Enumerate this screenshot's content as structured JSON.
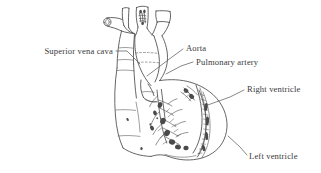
{
  "figure": {
    "background_color": "#ffffff",
    "line_color": "#4a4a4a",
    "text_color": "#3a3a3a",
    "style": "pen-and-ink line drawing with hatched shading"
  },
  "labels": [
    {
      "id": "superior-vena-cava",
      "text": "Superior vena cava",
      "align": "end",
      "text_x": 113,
      "text_y": 54,
      "leader": "M 116,51 L 127,51 L 140,64"
    },
    {
      "id": "aorta",
      "text": "Aorta",
      "align": "start",
      "text_x": 186,
      "text_y": 51,
      "leader": "M 183,49 L 172,57 L 147,76"
    },
    {
      "id": "pulmonary-artery",
      "text": "Pulmonary artery",
      "align": "start",
      "text_x": 196,
      "text_y": 65,
      "leader": "M 193,62 L 181,66 L 166,74"
    },
    {
      "id": "right-ventricle",
      "text": "Right ventricle",
      "align": "start",
      "text_x": 247,
      "text_y": 92,
      "leader": "M 244,90 L 230,97 L 205,106"
    },
    {
      "id": "left-ventricle",
      "text": "Left ventricle",
      "align": "start",
      "text_x": 249,
      "text_y": 159,
      "leader": "M 247,155 L 240,147 L 228,136"
    }
  ],
  "anatomy_parts": [
    "superior vena cava",
    "aortic arch",
    "brachiocephalic trunk",
    "left common carotid artery",
    "left subclavian artery",
    "pulmonary artery",
    "right atrium",
    "right ventricle",
    "left ventricle",
    "coronary arteries"
  ]
}
